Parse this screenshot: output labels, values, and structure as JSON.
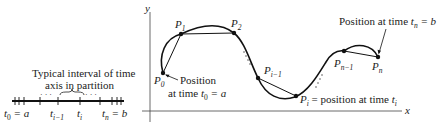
{
  "figure": {
    "partition_panel": {
      "caption_line1": "Typical interval of time",
      "caption_line2": "axis in partition",
      "ticks": [
        {
          "base": "t",
          "sub": "0",
          "suffix": " = a"
        },
        {
          "base": "t",
          "sub": "i−1",
          "suffix": ""
        },
        {
          "base": "t",
          "sub": "i",
          "suffix": ""
        },
        {
          "base": "t",
          "sub": "n",
          "suffix": " = b"
        }
      ],
      "dots": "· · ·"
    },
    "curve_panel": {
      "axis_y": "y",
      "axis_x": "x",
      "points": [
        {
          "base": "P",
          "sub": "0"
        },
        {
          "base": "P",
          "sub": "1"
        },
        {
          "base": "P",
          "sub": "2"
        },
        {
          "base": "P",
          "sub": "i−1"
        },
        {
          "base": "P",
          "sub": "i"
        },
        {
          "base": "P",
          "sub": "n−1"
        },
        {
          "base": "P",
          "sub": "n"
        }
      ],
      "annotations": {
        "start_line1": "Position",
        "start_line2_prefix": "at time ",
        "start_t": "t",
        "start_sub": "0",
        "start_suffix": " = a",
        "end_prefix": "Position at time ",
        "end_t": "t",
        "end_sub": "n",
        "end_suffix": " = b",
        "pi_suffix": " = position at time ",
        "pi_t": "t",
        "pi_sub": "i"
      }
    }
  }
}
